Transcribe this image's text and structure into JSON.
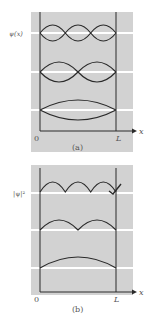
{
  "figure": {
    "colors": {
      "panel": "#d2d2d2",
      "curve": "#2a2a2a",
      "baseline": "#ffffff",
      "text": "#555555"
    },
    "panel_a": {
      "y_label": "ψ(x)",
      "x_label": "x",
      "origin_label": "0",
      "end_label": "L",
      "caption": "(a)",
      "modes": [
        {
          "n": 3,
          "description": "wavefunction with 3 antinodes and 2 internal nodes, drawn as ± envelope"
        },
        {
          "n": 2,
          "description": "wavefunction with 2 antinodes and 1 internal node, drawn as ± envelope"
        },
        {
          "n": 1,
          "description": "ground state, single antinode, drawn as ± envelope"
        }
      ]
    },
    "panel_b": {
      "y_label": "|ψ|²",
      "x_label": "x",
      "origin_label": "0",
      "end_label": "L",
      "caption": "(b)",
      "modes": [
        {
          "n": 3,
          "description": "probability density with 3 humps"
        },
        {
          "n": 2,
          "description": "probability density with 2 humps"
        },
        {
          "n": 1,
          "description": "probability density with 1 hump"
        }
      ]
    }
  }
}
